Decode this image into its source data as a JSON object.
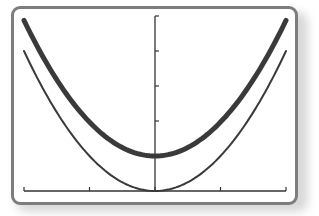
{
  "chart_data": {
    "type": "line",
    "title": "",
    "xlabel": "",
    "ylabel": "",
    "xlim": [
      -2,
      2
    ],
    "ylim": [
      0,
      5
    ],
    "x_ticks": [
      -2,
      -1,
      0,
      1,
      2
    ],
    "y_ticks": [
      0,
      1,
      2,
      3,
      4,
      5
    ],
    "tick_labels_shown": false,
    "grid": false,
    "legend": null,
    "series": [
      {
        "name": "thick curve",
        "stroke_width": "thick",
        "color": "#3a3a3a",
        "description": "upward parabola, vertex (0,1)",
        "x": [
          -2,
          -1.5,
          -1,
          -0.5,
          0,
          0.5,
          1,
          1.5,
          2
        ],
        "y": [
          4.85,
          3.2,
          2.0,
          1.25,
          1.0,
          1.25,
          2.0,
          3.2,
          4.9
        ]
      },
      {
        "name": "thin curve",
        "stroke_width": "thin",
        "color": "#3a3a3a",
        "description": "upward parabola, vertex (0,0)",
        "x": [
          -2,
          -1.5,
          -1,
          -0.5,
          0,
          0.5,
          1,
          1.5,
          2
        ],
        "y": [
          4.0,
          2.25,
          1.0,
          0.25,
          0.0,
          0.25,
          1.0,
          2.25,
          4.0
        ]
      }
    ]
  },
  "colors": {
    "frame_border": "#7d7d7d",
    "axis": "#333333",
    "curve": "#3a3a3a",
    "background": "#ffffff"
  }
}
